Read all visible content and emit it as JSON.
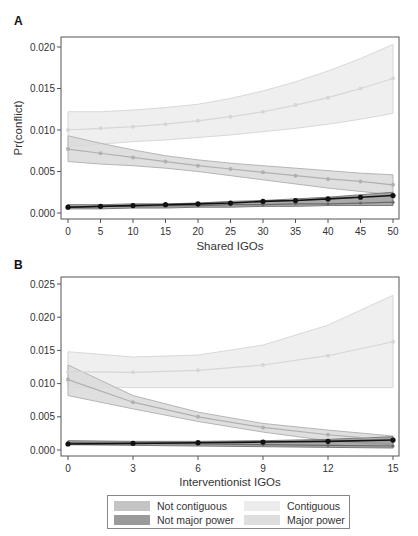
{
  "panels": {
    "a": {
      "label": "A",
      "xlabel": "Shared IGOs",
      "ylabel": "Pr(conflict)"
    },
    "b": {
      "label": "B",
      "xlabel": "Interventionist IGOs",
      "ylabel": ""
    }
  },
  "legend": {
    "items": [
      {
        "label": "Not contiguous",
        "color": "#c4c4c4"
      },
      {
        "label": "Not major power",
        "color": "#9a9a9a"
      },
      {
        "label": "Contiguous",
        "color": "#ececec"
      },
      {
        "label": "Major power",
        "color": "#dedede"
      }
    ]
  },
  "chart_data": [
    {
      "type": "line",
      "title": "A",
      "xlabel": "Shared IGOs",
      "ylabel": "Pr(conflict)",
      "x": [
        0,
        5,
        10,
        15,
        20,
        25,
        30,
        35,
        40,
        45,
        50
      ],
      "xticks": [
        "0",
        "5",
        "10",
        "15",
        "20",
        "25",
        "30",
        "35",
        "40",
        "45",
        "50"
      ],
      "yticks": [
        "0.000",
        "0.005",
        "0.010",
        "0.015",
        "0.020"
      ],
      "ylim": [
        0.0,
        0.021
      ],
      "series": [
        {
          "name": "Contiguous",
          "values": [
            0.01,
            0.0102,
            0.0104,
            0.0107,
            0.0111,
            0.0116,
            0.0122,
            0.013,
            0.0139,
            0.015,
            0.0162
          ],
          "ci_upper": [
            0.0122,
            0.0122,
            0.0124,
            0.0127,
            0.0131,
            0.0138,
            0.0147,
            0.0158,
            0.0171,
            0.0186,
            0.0203
          ],
          "ci_lower": [
            0.008,
            0.0083,
            0.0086,
            0.0088,
            0.0091,
            0.0094,
            0.0098,
            0.0102,
            0.0107,
            0.0113,
            0.012
          ]
        },
        {
          "name": "Not contiguous",
          "values": [
            0.0077,
            0.0072,
            0.0067,
            0.0062,
            0.0057,
            0.0053,
            0.0049,
            0.0045,
            0.0041,
            0.0038,
            0.0034
          ],
          "ci_upper": [
            0.0093,
            0.0084,
            0.0076,
            0.0069,
            0.0064,
            0.006,
            0.0057,
            0.0054,
            0.0051,
            0.0048,
            0.0046
          ],
          "ci_lower": [
            0.0062,
            0.0059,
            0.0057,
            0.0054,
            0.005,
            0.0045,
            0.004,
            0.0035,
            0.003,
            0.0026,
            0.0022
          ]
        },
        {
          "name": "Not major power",
          "values": [
            0.0007,
            0.0008,
            0.0008,
            0.0009,
            0.0009,
            0.001,
            0.001,
            0.0011,
            0.0011,
            0.0012,
            0.0013
          ],
          "ci_upper": [
            0.001,
            0.001,
            0.0011,
            0.0011,
            0.0012,
            0.0014,
            0.0015,
            0.0017,
            0.0019,
            0.0022,
            0.0025
          ],
          "ci_lower": [
            0.0005,
            0.0005,
            0.0006,
            0.0006,
            0.0007,
            0.0007,
            0.0008,
            0.0008,
            0.0009,
            0.0009,
            0.0009
          ]
        },
        {
          "name": "Major power",
          "values": [
            0.0007,
            0.0008,
            0.0009,
            0.001,
            0.0011,
            0.0012,
            0.0014,
            0.0015,
            0.0017,
            0.0019,
            0.0021
          ]
        }
      ]
    },
    {
      "type": "line",
      "title": "B",
      "xlabel": "Interventionist IGOs",
      "ylabel": "",
      "x": [
        0,
        3,
        6,
        9,
        12,
        15
      ],
      "xticks": [
        "0",
        "3",
        "6",
        "9",
        "12",
        "15"
      ],
      "yticks": [
        "0.000",
        "0.005",
        "0.010",
        "0.015",
        "0.020",
        "0.025"
      ],
      "ylim": [
        0.0,
        0.026
      ],
      "series": [
        {
          "name": "Contiguous",
          "values": [
            0.0118,
            0.0117,
            0.012,
            0.0128,
            0.0142,
            0.0163
          ],
          "ci_upper": [
            0.0148,
            0.014,
            0.0143,
            0.0158,
            0.0188,
            0.0233
          ],
          "ci_lower": [
            0.0094,
            0.0094,
            0.0094,
            0.0094,
            0.0094,
            0.0094
          ]
        },
        {
          "name": "Not contiguous",
          "values": [
            0.0106,
            0.0072,
            0.005,
            0.0034,
            0.0023,
            0.0015
          ],
          "ci_upper": [
            0.0128,
            0.0082,
            0.0057,
            0.004,
            0.003,
            0.0021
          ],
          "ci_lower": [
            0.0082,
            0.0062,
            0.0043,
            0.0027,
            0.0014,
            0.0008
          ]
        },
        {
          "name": "Not major power",
          "values": [
            0.0011,
            0.001,
            0.0009,
            0.0008,
            0.0007,
            0.0006
          ],
          "ci_upper": [
            0.0014,
            0.0013,
            0.0013,
            0.0014,
            0.0016,
            0.002
          ],
          "ci_lower": [
            0.0008,
            0.0007,
            0.0006,
            0.0005,
            0.0004,
            0.0003
          ]
        },
        {
          "name": "Major power",
          "values": [
            0.0009,
            0.001,
            0.0011,
            0.0012,
            0.0013,
            0.0015
          ]
        }
      ]
    }
  ]
}
